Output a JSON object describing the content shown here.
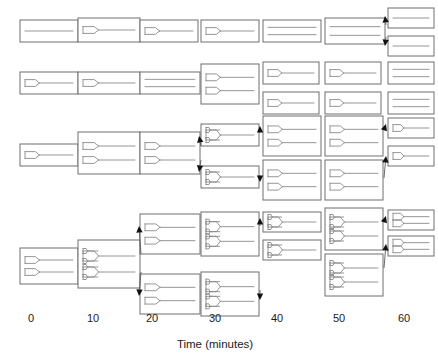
{
  "figure": {
    "type": "lineage-diagram",
    "background_color": "#ffffff",
    "box_stroke_color": "#6e6e6e",
    "chromosome_stroke_color": "#8a8a8a",
    "arrow_color": "#111111"
  },
  "axis": {
    "title": "Time (minutes)",
    "title_x": 215,
    "title_y": 348,
    "tick_labels": [
      "0",
      "10",
      "20",
      "30",
      "40",
      "50",
      "60"
    ],
    "tick_values": [
      0,
      10,
      20,
      30,
      40,
      50,
      60
    ],
    "tick_x": [
      31,
      93,
      152,
      215,
      277,
      339,
      404
    ],
    "tick_y": 322
  },
  "columns": [
    {
      "time": 0,
      "x": 31
    },
    {
      "time": 10,
      "x": 93
    },
    {
      "time": 20,
      "x": 152
    },
    {
      "time": 30,
      "x": 215
    },
    {
      "time": 40,
      "x": 277
    },
    {
      "time": 50,
      "x": 339
    },
    {
      "time": 60,
      "x": 404
    }
  ],
  "legend_note": "Each rectangle is a cell; internal lines are chromosomes; forked lines are replication forks.",
  "cells": [
    {
      "id": "r1c0",
      "row": 1,
      "time": 0,
      "x": 20,
      "y": 20,
      "w": 58,
      "h": 22,
      "forks": 0,
      "chromosomes": 1,
      "note": "unreplicated chromosome"
    },
    {
      "id": "r1c1",
      "row": 1,
      "time": 10,
      "x": 78,
      "y": 18,
      "w": 62,
      "h": 24,
      "forks": 1,
      "chromosomes": 1,
      "note": "replication initiated"
    },
    {
      "id": "r1c2",
      "row": 1,
      "time": 20,
      "x": 140,
      "y": 20,
      "w": 58,
      "h": 22,
      "forks": 1,
      "chromosomes": 1,
      "note": "fork advanced"
    },
    {
      "id": "r1c3",
      "row": 1,
      "time": 30,
      "x": 201,
      "y": 20,
      "w": 58,
      "h": 22,
      "forks": 1,
      "chromosomes": 1,
      "note": "fork nearly complete"
    },
    {
      "id": "r1c4",
      "row": 1,
      "time": 40,
      "x": 263,
      "y": 20,
      "w": 58,
      "h": 22,
      "forks": 0,
      "chromosomes": 2,
      "note": "replication complete, two chromosomes"
    },
    {
      "id": "r1c5",
      "row": 1,
      "time": 50,
      "x": 325,
      "y": 18,
      "w": 60,
      "h": 26,
      "forks": 0,
      "chromosomes": 2,
      "note": "pre-division"
    },
    {
      "id": "r1c6a",
      "row": 1,
      "time": 60,
      "x": 388,
      "y": 8,
      "w": 46,
      "h": 20,
      "forks": 0,
      "chromosomes": 1,
      "note": "daughter cell"
    },
    {
      "id": "r1c6b",
      "row": 1,
      "time": 60,
      "x": 388,
      "y": 36,
      "w": 46,
      "h": 20,
      "forks": 0,
      "chromosomes": 1,
      "note": "daughter cell"
    },
    {
      "id": "r2c0",
      "row": 2,
      "time": 0,
      "x": 20,
      "y": 72,
      "w": 58,
      "h": 22,
      "forks": 1,
      "chromosomes": 1
    },
    {
      "id": "r2c1",
      "row": 2,
      "time": 10,
      "x": 78,
      "y": 72,
      "w": 62,
      "h": 22,
      "forks": 1,
      "chromosomes": 1
    },
    {
      "id": "r2c2",
      "row": 2,
      "time": 20,
      "x": 140,
      "y": 72,
      "w": 60,
      "h": 22,
      "forks": 0,
      "chromosomes": 2
    },
    {
      "id": "r2c3",
      "row": 2,
      "time": 30,
      "x": 201,
      "y": 64,
      "w": 58,
      "h": 40,
      "forks": 2,
      "chromosomes": 2,
      "note": "two replicating chromosomes"
    },
    {
      "id": "r2c4a",
      "row": 2,
      "time": 40,
      "x": 263,
      "y": 62,
      "w": 56,
      "h": 22,
      "forks": 1,
      "chromosomes": 1
    },
    {
      "id": "r2c4b",
      "row": 2,
      "time": 40,
      "x": 263,
      "y": 92,
      "w": 56,
      "h": 22,
      "forks": 1,
      "chromosomes": 1
    },
    {
      "id": "r2c5a",
      "row": 2,
      "time": 50,
      "x": 325,
      "y": 62,
      "w": 56,
      "h": 22,
      "forks": 1,
      "chromosomes": 1
    },
    {
      "id": "r2c5b",
      "row": 2,
      "time": 50,
      "x": 325,
      "y": 92,
      "w": 56,
      "h": 22,
      "forks": 1,
      "chromosomes": 1
    },
    {
      "id": "r2c6a",
      "row": 2,
      "time": 60,
      "x": 388,
      "y": 62,
      "w": 46,
      "h": 22,
      "forks": 0,
      "chromosomes": 2
    },
    {
      "id": "r2c6b",
      "row": 2,
      "time": 60,
      "x": 388,
      "y": 92,
      "w": 46,
      "h": 22,
      "forks": 0,
      "chromosomes": 2
    },
    {
      "id": "r3c0",
      "row": 3,
      "time": 0,
      "x": 20,
      "y": 144,
      "w": 58,
      "h": 22,
      "forks": 1,
      "chromosomes": 1
    },
    {
      "id": "r3c1",
      "row": 3,
      "time": 10,
      "x": 78,
      "y": 132,
      "w": 62,
      "h": 42,
      "forks": 2,
      "chromosomes": 2
    },
    {
      "id": "r3c2",
      "row": 3,
      "time": 20,
      "x": 140,
      "y": 132,
      "w": 60,
      "h": 42,
      "forks": 2,
      "chromosomes": 2
    },
    {
      "id": "r3c3a",
      "row": 3,
      "time": 30,
      "x": 201,
      "y": 124,
      "w": 58,
      "h": 22,
      "forks": 2,
      "chromosomes": 1
    },
    {
      "id": "r3c3b",
      "row": 3,
      "time": 30,
      "x": 201,
      "y": 166,
      "w": 58,
      "h": 22,
      "forks": 2,
      "chromosomes": 1
    },
    {
      "id": "r3c4a",
      "row": 3,
      "time": 40,
      "x": 263,
      "y": 116,
      "w": 58,
      "h": 40,
      "forks": 2,
      "chromosomes": 2
    },
    {
      "id": "r3c4b",
      "row": 3,
      "time": 40,
      "x": 263,
      "y": 160,
      "w": 58,
      "h": 40,
      "forks": 2,
      "chromosomes": 2
    },
    {
      "id": "r3c5a",
      "row": 3,
      "time": 50,
      "x": 325,
      "y": 116,
      "w": 58,
      "h": 40,
      "forks": 2,
      "chromosomes": 2
    },
    {
      "id": "r3c5b",
      "row": 3,
      "time": 50,
      "x": 325,
      "y": 160,
      "w": 58,
      "h": 40,
      "forks": 2,
      "chromosomes": 2
    },
    {
      "id": "r3c6a",
      "row": 3,
      "time": 60,
      "x": 388,
      "y": 118,
      "w": 46,
      "h": 20,
      "forks": 1,
      "chromosomes": 1
    },
    {
      "id": "r3c6b",
      "row": 3,
      "time": 60,
      "x": 388,
      "y": 146,
      "w": 46,
      "h": 20,
      "forks": 1,
      "chromosomes": 1
    },
    {
      "id": "r4c0",
      "row": 4,
      "time": 0,
      "x": 20,
      "y": 248,
      "w": 58,
      "h": 36,
      "forks": 2,
      "chromosomes": 2
    },
    {
      "id": "r4c1",
      "row": 4,
      "time": 10,
      "x": 78,
      "y": 240,
      "w": 62,
      "h": 48,
      "forks": 4,
      "chromosomes": 2,
      "note": "multifork replication"
    },
    {
      "id": "r4c2a",
      "row": 4,
      "time": 20,
      "x": 140,
      "y": 214,
      "w": 60,
      "h": 40,
      "forks": 2,
      "chromosomes": 2
    },
    {
      "id": "r4c2b",
      "row": 4,
      "time": 20,
      "x": 140,
      "y": 274,
      "w": 60,
      "h": 40,
      "forks": 2,
      "chromosomes": 2
    },
    {
      "id": "r4c3a",
      "row": 4,
      "time": 30,
      "x": 201,
      "y": 212,
      "w": 58,
      "h": 44,
      "forks": 4,
      "chromosomes": 2
    },
    {
      "id": "r4c3b",
      "row": 4,
      "time": 30,
      "x": 201,
      "y": 272,
      "w": 58,
      "h": 44,
      "forks": 4,
      "chromosomes": 2
    },
    {
      "id": "r4c4a",
      "row": 4,
      "time": 40,
      "x": 263,
      "y": 212,
      "w": 58,
      "h": 20,
      "forks": 3,
      "chromosomes": 1
    },
    {
      "id": "r4c4b",
      "row": 4,
      "time": 40,
      "x": 263,
      "y": 240,
      "w": 58,
      "h": 20,
      "forks": 3,
      "chromosomes": 1
    },
    {
      "id": "r4c5a",
      "row": 4,
      "time": 50,
      "x": 325,
      "y": 208,
      "w": 58,
      "h": 42,
      "forks": 4,
      "chromosomes": 2
    },
    {
      "id": "r4c5b",
      "row": 4,
      "time": 50,
      "x": 325,
      "y": 254,
      "w": 58,
      "h": 42,
      "forks": 4,
      "chromosomes": 2
    },
    {
      "id": "r4c6a",
      "row": 4,
      "time": 60,
      "x": 388,
      "y": 210,
      "w": 46,
      "h": 20,
      "forks": 2,
      "chromosomes": 2
    },
    {
      "id": "r4c6b",
      "row": 4,
      "time": 60,
      "x": 388,
      "y": 236,
      "w": 46,
      "h": 20,
      "forks": 2,
      "chromosomes": 2
    }
  ],
  "division_arrows": [
    {
      "from": "r1c5",
      "x1": 386,
      "y1": 25,
      "x2": 385,
      "y2": 16
    },
    {
      "from": "r1c5",
      "x1": 386,
      "y1": 37,
      "x2": 385,
      "y2": 46
    },
    {
      "from": "r3c2",
      "x1": 201,
      "y1": 146,
      "x2": 199,
      "y2": 136
    },
    {
      "from": "r3c2",
      "x1": 201,
      "y1": 160,
      "x2": 199,
      "y2": 172
    },
    {
      "from": "r3c3a",
      "x1": 260,
      "y1": 132,
      "x2": 260,
      "y2": 126
    },
    {
      "from": "r3c3b",
      "x1": 260,
      "y1": 176,
      "x2": 260,
      "y2": 182
    },
    {
      "from": "r3c5a",
      "x1": 384,
      "y1": 130,
      "x2": 386,
      "y2": 124
    },
    {
      "from": "r3c5b",
      "x1": 384,
      "y1": 178,
      "x2": 386,
      "y2": 156
    },
    {
      "from": "r4c1",
      "x1": 141,
      "y1": 254,
      "x2": 139,
      "y2": 226
    },
    {
      "from": "r4c1",
      "x1": 141,
      "y1": 272,
      "x2": 139,
      "y2": 296
    },
    {
      "from": "r4c3a",
      "x1": 260,
      "y1": 226,
      "x2": 260,
      "y2": 218
    },
    {
      "from": "r4c3b",
      "x1": 260,
      "y1": 290,
      "x2": 260,
      "y2": 300
    },
    {
      "from": "r4c5a",
      "x1": 384,
      "y1": 222,
      "x2": 386,
      "y2": 216
    },
    {
      "from": "r4c5b",
      "x1": 384,
      "y1": 268,
      "x2": 386,
      "y2": 244
    }
  ]
}
